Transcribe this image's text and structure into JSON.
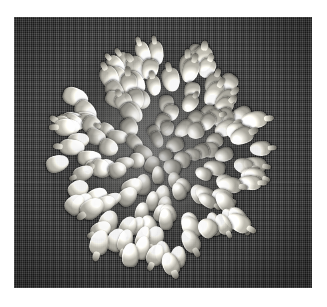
{
  "page": {
    "kind": "photograph",
    "color_mode": "grayscale",
    "width": 327,
    "height": 307,
    "border_color": "#ffffff"
  },
  "photo": {
    "caption": "",
    "subject": "dense circular arrangement of pale corn kernels",
    "background_material": "dark woven burlap cloth",
    "background_color": "#3e3e3e",
    "kernel_color_light": "#f6f5f0",
    "kernel_color_mid": "#b4b2a9",
    "kernel_color_dark": "#605e57",
    "shadow_color": "#1a1a1a",
    "frame": {
      "left": 14,
      "top": 17,
      "width": 298,
      "height": 271
    },
    "cluster": {
      "center_x": 146,
      "center_y": 138,
      "radius_x": 104,
      "radius_y": 108,
      "kernel_count": 148,
      "arrangement": "radial, kernels oriented outward from centre"
    },
    "seams": [
      {
        "label": "cloth-fold-upper",
        "y": 165
      },
      {
        "label": "cloth-fold-lower",
        "y": 239
      }
    ]
  }
}
